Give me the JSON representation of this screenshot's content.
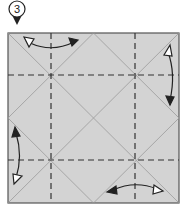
{
  "diagram": {
    "type": "origami-fold-step",
    "step": {
      "number": "3",
      "marker_shape": "circle-with-down-pointer"
    },
    "paper": {
      "shape": "square",
      "fill_color": "#d3d3d3",
      "border_color": "#555555",
      "crease_color": "#9a9a9a",
      "fold_line_color": "#333333"
    },
    "creases": {
      "existing": [
        "diagonal-top-left-to-bottom-right",
        "diagonal-top-right-to-bottom-left",
        "diamond-through-edge-midpoints"
      ],
      "valley_folds_dashed": [
        "vertical-at-1/4",
        "vertical-at-3/4",
        "horizontal-at-1/4",
        "horizontal-at-3/4"
      ]
    },
    "arrows": [
      {
        "position": "top-left",
        "direction": "fold-and-unfold",
        "hollow_head": "left",
        "solid_head": "right"
      },
      {
        "position": "right-top",
        "direction": "fold-and-unfold",
        "hollow_head": "top",
        "solid_head": "bottom"
      },
      {
        "position": "left-bottom",
        "direction": "fold-and-unfold",
        "hollow_head": "bottom",
        "solid_head": "top"
      },
      {
        "position": "bottom-right",
        "direction": "fold-and-unfold",
        "hollow_head": "right",
        "solid_head": "left"
      }
    ]
  }
}
